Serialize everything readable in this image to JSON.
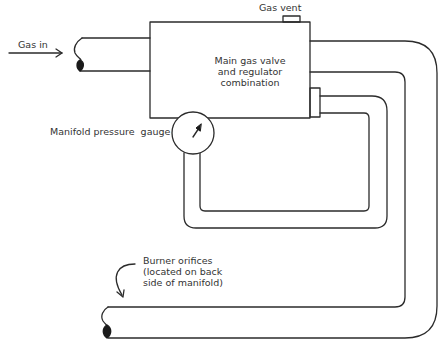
{
  "diagram": {
    "colors": {
      "line": "#2b2b2b",
      "text": "#333333",
      "background": "#ffffff"
    },
    "labels": {
      "gas_in": "Gas in",
      "gas_vent": "Gas vent",
      "main_valve_line1": "Main gas valve",
      "main_valve_line2": "and regulator",
      "main_valve_line3": "combination",
      "gauge": "Manifold pressure  gauge",
      "burner_line1": "Burner orifices",
      "burner_line2": "(located on back",
      "burner_line3": "side of manifold)"
    },
    "components": [
      {
        "id": "gas-inlet-pipe",
        "label": "Gas in"
      },
      {
        "id": "main-gas-valve-regulator",
        "label": "Main gas valve and regulator combination"
      },
      {
        "id": "gas-vent",
        "label": "Gas vent"
      },
      {
        "id": "manifold-pressure-gauge",
        "label": "Manifold pressure gauge"
      },
      {
        "id": "burner-manifold",
        "label": "Burner orifices (located on back side of manifold)"
      }
    ],
    "connections": [
      {
        "from": "gas-inlet-pipe",
        "to": "main-gas-valve-regulator"
      },
      {
        "from": "main-gas-valve-regulator",
        "to": "burner-manifold"
      },
      {
        "from": "main-gas-valve-regulator",
        "to": "manifold-pressure-gauge"
      }
    ]
  }
}
